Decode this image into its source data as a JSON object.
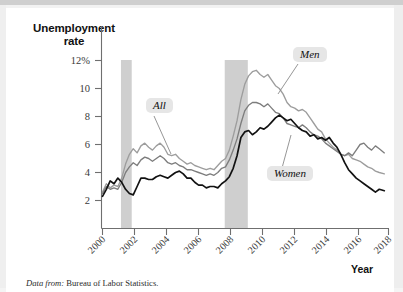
{
  "figure": {
    "source_prefix": "Data from:",
    "source_text": "Bureau of Labor Statistics.",
    "xaxis_title": "Year"
  },
  "chart_data": {
    "type": "line",
    "title": "",
    "ylabel": "Unemployment rate",
    "xlabel": "Year",
    "xlim": [
      2000,
      2018.6
    ],
    "ylim": [
      0,
      12.9
    ],
    "grid": false,
    "legend": "annotated-callouts",
    "y_ticks": [
      2,
      4,
      6,
      8,
      10,
      12
    ],
    "y_tick_labels": [
      "2",
      "4",
      "6",
      "8",
      "10",
      "12%"
    ],
    "x_ticks": [
      2000,
      2002,
      2004,
      2006,
      2008,
      2010,
      2012,
      2014,
      2016,
      2018
    ],
    "x_tick_labels": [
      "2000",
      "2002",
      "2004",
      "2006",
      "2008",
      "2010",
      "2012",
      "2014",
      "2016",
      "2018"
    ],
    "annotations": [
      {
        "label": "All",
        "color": "#7d7d7d"
      },
      {
        "label": "Men",
        "color": "#9d9d9d"
      },
      {
        "label": "Women",
        "color": "#121212"
      }
    ],
    "shaded_regions": [
      {
        "name": "recession-2001",
        "x_start": 2001.2,
        "x_end": 2001.9,
        "color": "#cfcfcf"
      },
      {
        "name": "recession-2008",
        "x_start": 2007.95,
        "x_end": 2009.45,
        "color": "#cfcfcf"
      }
    ],
    "x": [
      2000.0,
      2000.25,
      2000.5,
      2000.75,
      2001.0,
      2001.25,
      2001.5,
      2001.75,
      2002.0,
      2002.25,
      2002.5,
      2002.75,
      2003.0,
      2003.25,
      2003.5,
      2003.75,
      2004.0,
      2004.25,
      2004.5,
      2004.75,
      2005.0,
      2005.25,
      2005.5,
      2005.75,
      2006.0,
      2006.25,
      2006.5,
      2006.75,
      2007.0,
      2007.25,
      2007.5,
      2007.75,
      2008.0,
      2008.25,
      2008.5,
      2008.75,
      2009.0,
      2009.25,
      2009.5,
      2009.75,
      2010.0,
      2010.25,
      2010.5,
      2010.75,
      2011.0,
      2011.25,
      2011.5,
      2011.75,
      2012.0,
      2012.25,
      2012.5,
      2012.75,
      2013.0,
      2013.25,
      2013.5,
      2013.75,
      2014.0,
      2014.25,
      2014.5,
      2014.75,
      2015.0,
      2015.25,
      2015.5,
      2015.75,
      2016.0,
      2016.25,
      2016.5,
      2016.75,
      2017.0,
      2017.25,
      2017.5,
      2017.75,
      2018.0,
      2018.33
    ],
    "series": [
      {
        "name": "Men",
        "color": "#9d9d9d",
        "values": [
          2.6,
          3.2,
          2.9,
          3.1,
          3.0,
          3.6,
          4.6,
          5.3,
          5.7,
          5.4,
          5.9,
          6.1,
          5.8,
          5.6,
          5.9,
          6.1,
          5.8,
          5.3,
          5.2,
          5.3,
          5.0,
          4.8,
          4.6,
          4.7,
          4.5,
          4.4,
          4.3,
          4.2,
          4.3,
          4.2,
          4.5,
          4.8,
          5.0,
          5.6,
          6.6,
          7.7,
          9.2,
          10.3,
          10.9,
          11.2,
          11.3,
          11.0,
          10.8,
          11.0,
          10.6,
          10.2,
          10.0,
          9.6,
          9.0,
          8.7,
          8.6,
          8.4,
          8.5,
          8.3,
          7.9,
          7.5,
          7.1,
          6.9,
          6.4,
          6.1,
          5.8,
          5.6,
          5.3,
          5.2,
          5.3,
          5.0,
          4.9,
          4.8,
          4.6,
          4.4,
          4.3,
          4.1,
          4.0,
          3.9
        ]
      },
      {
        "name": "All",
        "color": "#7d7d7d",
        "values": [
          2.5,
          3.0,
          2.8,
          2.9,
          2.8,
          3.3,
          4.0,
          4.4,
          4.7,
          4.5,
          4.9,
          5.1,
          5.0,
          4.8,
          5.0,
          5.2,
          5.0,
          4.7,
          4.6,
          4.7,
          4.5,
          4.4,
          4.2,
          4.2,
          4.1,
          4.0,
          3.9,
          3.8,
          3.9,
          3.8,
          4.0,
          4.3,
          4.4,
          4.9,
          5.6,
          6.4,
          7.5,
          8.4,
          8.8,
          9.0,
          9.0,
          8.9,
          8.7,
          8.9,
          8.6,
          8.3,
          8.2,
          7.9,
          7.5,
          7.4,
          7.3,
          7.2,
          7.4,
          7.2,
          6.9,
          6.7,
          6.6,
          6.4,
          6.1,
          5.9,
          5.7,
          5.5,
          5.3,
          5.2,
          5.4,
          5.2,
          5.6,
          6.0,
          6.1,
          5.8,
          5.6,
          5.9,
          5.7,
          5.4
        ]
      },
      {
        "name": "Women",
        "color": "#121212",
        "values": [
          2.3,
          2.8,
          3.4,
          3.2,
          3.6,
          3.3,
          2.8,
          2.5,
          2.4,
          3.0,
          3.6,
          3.6,
          3.5,
          3.5,
          3.7,
          3.8,
          3.7,
          3.6,
          3.8,
          4.0,
          4.1,
          3.9,
          3.6,
          3.6,
          3.3,
          3.1,
          3.1,
          2.9,
          3.0,
          3.0,
          2.9,
          3.2,
          3.4,
          3.7,
          4.3,
          5.2,
          6.5,
          6.9,
          7.0,
          6.7,
          6.9,
          7.2,
          7.1,
          7.3,
          7.6,
          7.9,
          8.1,
          7.9,
          7.7,
          7.8,
          7.5,
          7.2,
          7.0,
          6.9,
          6.6,
          6.7,
          6.4,
          6.5,
          6.3,
          6.5,
          6.1,
          5.8,
          5.3,
          4.7,
          4.2,
          3.9,
          3.6,
          3.4,
          3.2,
          3.0,
          2.8,
          2.6,
          2.8,
          2.7
        ]
      }
    ]
  }
}
